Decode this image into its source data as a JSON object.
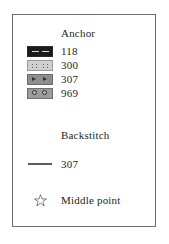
{
  "legend": {
    "sections": [
      {
        "heading": "Anchor",
        "entries": [
          {
            "symbol": "dash-block-symbol",
            "label": "118"
          },
          {
            "symbol": "dotted-block-symbol",
            "label": "300"
          },
          {
            "symbol": "arrow-block-symbol",
            "label": "307"
          },
          {
            "symbol": "circle-block-symbol",
            "label": "969"
          }
        ]
      },
      {
        "heading": "Backstitch",
        "entries": [
          {
            "symbol": "line-symbol",
            "label": "307"
          }
        ]
      }
    ],
    "footer": {
      "symbol": "star-icon",
      "label": "Middle point"
    },
    "colors": {
      "frame_border": "#6e6e6e",
      "text": "#231f1d",
      "symbol_118": "#1b1b1b",
      "symbol_300": "#cfcfcf",
      "symbol_307": "#8e8e8e",
      "symbol_969": "#9b9b9b",
      "backstitch_line": "#5d5d5d",
      "star_stroke": "#3d3d3d"
    }
  }
}
